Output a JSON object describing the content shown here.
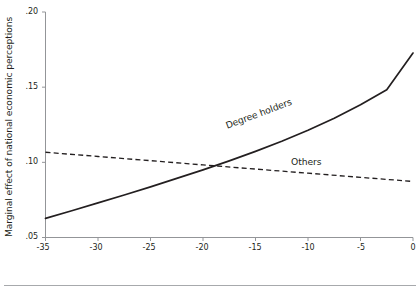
{
  "chart_data": {
    "type": "line",
    "title": "",
    "xlabel": "Campaign day",
    "ylabel": "Marginal effect of national economic perceptions",
    "xlim": [
      -35,
      0
    ],
    "ylim": [
      0.05,
      0.2
    ],
    "xticks": [
      -35,
      -30,
      -25,
      -20,
      -15,
      -10,
      -5,
      0
    ],
    "xticklabels": [
      "-35",
      "-30",
      "-25",
      "-20",
      "-15",
      "-10",
      "-5",
      "0"
    ],
    "yticks": [
      0.05,
      0.1,
      0.15,
      0.2
    ],
    "yticklabels": [
      ".05",
      ".10",
      ".15",
      ".20"
    ],
    "grid": false,
    "legend": "inline-annotations",
    "series": [
      {
        "name": "Degree holders",
        "style": "solid",
        "color": "#231f20",
        "x": [
          -35,
          -32.5,
          -30,
          -27.5,
          -25,
          -22.5,
          -20,
          -17.5,
          -15,
          -12.5,
          -10,
          -7.5,
          -5,
          -2.5,
          0
        ],
        "values": [
          0.0627,
          0.0678,
          0.073,
          0.0783,
          0.0837,
          0.0893,
          0.095,
          0.101,
          0.1073,
          0.114,
          0.1213,
          0.1293,
          0.1383,
          0.1483,
          0.1727
        ]
      },
      {
        "name": "Others",
        "style": "dashed",
        "color": "#231f20",
        "x": [
          -35,
          -30,
          -25,
          -20,
          -15,
          -10,
          -5,
          0
        ],
        "values": [
          0.1067,
          0.1039,
          0.1011,
          0.0983,
          0.0955,
          0.0928,
          0.09,
          0.0873
        ]
      }
    ],
    "annotations": [
      {
        "text": "Degree holders",
        "series": "Degree holders"
      },
      {
        "text": "Others",
        "series": "Others"
      }
    ]
  }
}
